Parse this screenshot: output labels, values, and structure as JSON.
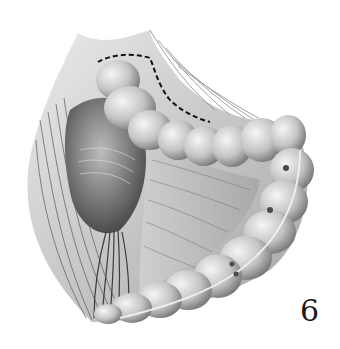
{
  "figure": {
    "number": "6",
    "colors": {
      "background": "#ffffff",
      "ink": "#1a1a1a",
      "dashed_line": "#111111"
    }
  }
}
